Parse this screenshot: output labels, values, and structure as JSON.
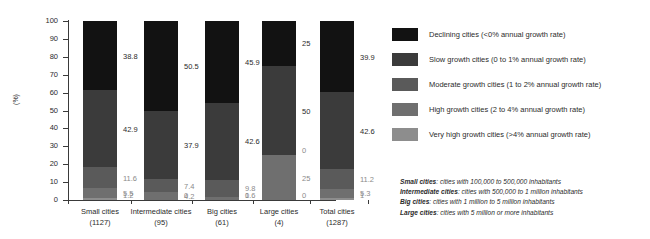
{
  "chart_data": {
    "type": "bar",
    "subtype": "stacked-bar-100",
    "title": "",
    "xlabel": "",
    "ylabel": "(%)",
    "ylim": [
      0,
      100
    ],
    "ytick_labels": [
      "0",
      "10",
      "20",
      "30",
      "40",
      "50",
      "60",
      "70",
      "80",
      "90",
      "100"
    ],
    "ytick_values": [
      0,
      10,
      20,
      30,
      40,
      50,
      60,
      70,
      80,
      90,
      100
    ],
    "grid": false,
    "legend_position": "right",
    "categories": [
      "Small cities",
      "Intermediate cities",
      "Big cities",
      "Large cities",
      "Total cities"
    ],
    "category_counts": [
      "(1127)",
      "(95)",
      "(61)",
      "(4)",
      "(1287)"
    ],
    "series": [
      {
        "name": "Very high growth cities (>4% annual growth rate)",
        "short_name": "Very high growth",
        "color": "#8d8d8d",
        "values": [
          1.2,
          0,
          0,
          0,
          1
        ],
        "labels": [
          "1.2",
          "0",
          "0",
          "0",
          "1"
        ]
      },
      {
        "name": "High growth cities (2 to 4% annual growth rate)",
        "short_name": "High growth",
        "color": "#6f6f6f",
        "values": [
          5.5,
          4.2,
          1.6,
          25,
          5.3
        ],
        "labels": [
          "5.5",
          "4.2",
          "1.6",
          "25",
          "5.3"
        ]
      },
      {
        "name": "Moderate growth cities (1 to 2% annual growth rate)",
        "short_name": "Moderate growth",
        "color": "#5a5a5a",
        "values": [
          11.6,
          7.4,
          9.8,
          0,
          11.2
        ],
        "labels": [
          "11.6",
          "7.4",
          "9.8",
          "0",
          "11.2"
        ]
      },
      {
        "name": "Slow growth cities (0 to 1% annual growth rate)",
        "short_name": "Slow growth",
        "color": "#3b3b3b",
        "values": [
          42.9,
          37.9,
          42.6,
          50,
          42.6
        ],
        "labels": [
          "42.9",
          "37.9",
          "42.6",
          "50",
          "42.6"
        ]
      },
      {
        "name": "Declining cities (<0% annual growth rate)",
        "short_name": "Declining",
        "color": "#121212",
        "values": [
          38.8,
          50.5,
          45.9,
          25,
          39.9
        ],
        "labels": [
          "38.8",
          "50.5",
          "45.9",
          "25",
          "39.9"
        ]
      }
    ]
  },
  "legend": {
    "items": [
      {
        "label": "Declining cities (<0% annual growth rate)",
        "color": "#121212"
      },
      {
        "label": "Slow growth cities (0 to 1% annual growth rate)",
        "color": "#3b3b3b"
      },
      {
        "label": "Moderate growth cities (1 to 2% annual growth rate)",
        "color": "#5a5a5a"
      },
      {
        "label": "High growth cities (2 to 4% annual growth rate)",
        "color": "#6f6f6f"
      },
      {
        "label": "Very high growth cities (>4% annual growth rate)",
        "color": "#8d8d8d"
      }
    ]
  },
  "footnotes": [
    {
      "term": "Small cities",
      "definition": ": cities with 100,000 to 500,000 inhabitants"
    },
    {
      "term": "Intermediate cities",
      "definition": ": cities with 500,000 to 1 million inhabitants"
    },
    {
      "term": "Big cities",
      "definition": ": cities with 1 million to 5 million inhabitants"
    },
    {
      "term": "Large cities",
      "definition": ": cities with 5 million or more inhabitants"
    }
  ]
}
